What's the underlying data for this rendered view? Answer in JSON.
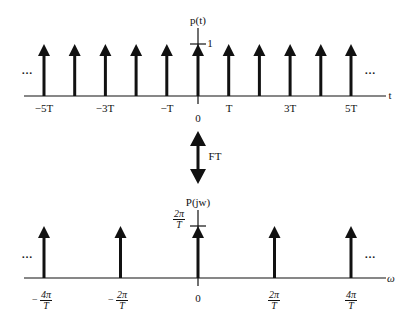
{
  "top_plot": {
    "y_label": "p(t)",
    "x_label": "t",
    "unit_tick_label": "1",
    "origin_label": "0",
    "tick_labels": [
      "−5T",
      "−3T",
      "−T",
      "T",
      "3T",
      "5T"
    ],
    "ellipsis": "…"
  },
  "transform": {
    "label": "FT"
  },
  "bottom_plot": {
    "y_label": "P(jw)",
    "x_label": "ω",
    "height_label": {
      "num": "2π",
      "den": "T"
    },
    "origin_label": "0",
    "ticks": [
      {
        "sign": "−",
        "num": "4π",
        "den": "T"
      },
      {
        "sign": "−",
        "num": "2π",
        "den": "T"
      },
      {
        "sign": "",
        "num": "2π",
        "den": "T"
      },
      {
        "sign": "",
        "num": "4π",
        "den": "T"
      }
    ],
    "ellipsis": "…"
  }
}
